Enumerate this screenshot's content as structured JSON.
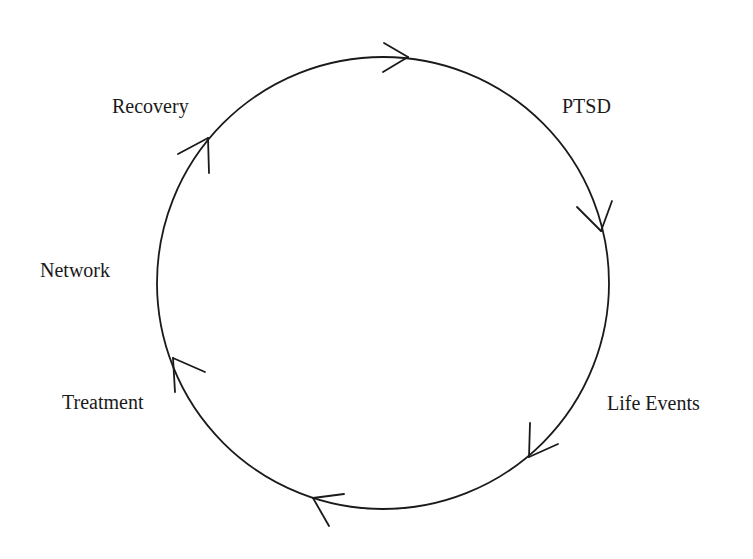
{
  "diagram": {
    "type": "cycle",
    "direction": "clockwise",
    "circle": {
      "cx": 383,
      "cy": 283,
      "r": 226,
      "stroke": "#1a1a1a",
      "stroke_width": 1.8
    },
    "nodes": [
      {
        "id": "ptsd",
        "label": "PTSD"
      },
      {
        "id": "life-events",
        "label": "Life Events"
      },
      {
        "id": "treatment",
        "label": "Treatment"
      },
      {
        "id": "network",
        "label": "Network"
      },
      {
        "id": "recovery",
        "label": "Recovery"
      }
    ],
    "arrows": [
      {
        "position": "top",
        "tip": [
          408,
          57
        ],
        "pointing": "right"
      },
      {
        "position": "right",
        "tip": [
          602,
          232
        ],
        "pointing": "down"
      },
      {
        "position": "bottom-right",
        "tip": [
          529,
          457
        ],
        "pointing": "down-left"
      },
      {
        "position": "bottom",
        "tip": [
          313,
          498
        ],
        "pointing": "left"
      },
      {
        "position": "left-lower",
        "tip": [
          173,
          358
        ],
        "pointing": "up"
      },
      {
        "position": "upper-left",
        "tip": [
          208,
          138
        ],
        "pointing": "up-right"
      }
    ],
    "colors": {
      "line": "#1a1a1a",
      "text": "#1a1a1a",
      "background": "#ffffff"
    }
  },
  "labels": {
    "recovery": "Recovery",
    "ptsd": "PTSD",
    "network": "Network",
    "life_events": "Life Events",
    "treatment": "Treatment"
  }
}
